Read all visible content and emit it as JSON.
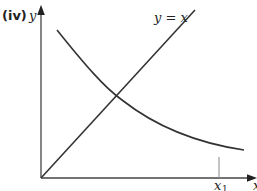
{
  "figure": {
    "panel_label": "(iv)",
    "y_axis_label": "y",
    "x_axis_label": "x",
    "line_label": "y = x",
    "marker_label": "x",
    "marker_subscript": "1",
    "stroke_color": "#333333",
    "axis_color": "#555555"
  }
}
